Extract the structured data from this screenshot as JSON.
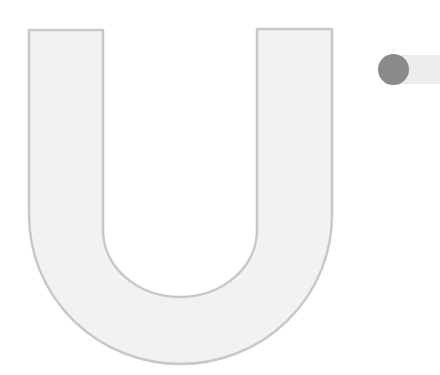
{
  "shape": {
    "glyph": "U",
    "fill": "#f2f2f2",
    "stroke": "#c8c8c8"
  },
  "toggle": {
    "state": "off",
    "knob_color": "#8a8a8a",
    "track_color": "#ececec"
  }
}
